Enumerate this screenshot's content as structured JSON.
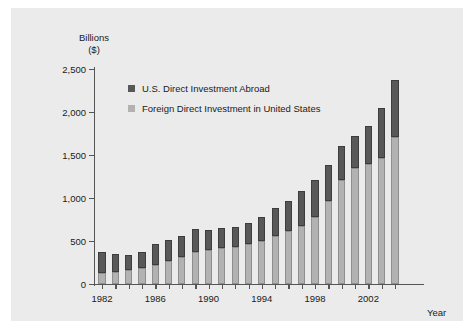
{
  "chart_data": {
    "type": "bar",
    "stacked": true,
    "title": "",
    "subtitle": "",
    "xlabel": "Year",
    "ylabel": "Billions\n($)",
    "ylim": [
      0,
      2500
    ],
    "ytick_labels": [
      "0",
      "500",
      "1,000",
      "1,500",
      "2,000",
      "2,500"
    ],
    "ytick_values": [
      0,
      500,
      1000,
      1500,
      2000,
      2500
    ],
    "xtick_labels": [
      "1982",
      "1986",
      "1990",
      "1994",
      "1998",
      "2002"
    ],
    "xtick_values": [
      1982,
      1986,
      1990,
      1994,
      1998,
      2002
    ],
    "grid": false,
    "legend_position": "upper-left-inside",
    "categories": [
      1982,
      1983,
      1984,
      1985,
      1986,
      1987,
      1988,
      1989,
      1990,
      1991,
      1992,
      1993,
      1994,
      1995,
      1996,
      1997,
      1998,
      1999,
      2000,
      2001,
      2002,
      2003,
      2004
    ],
    "series": [
      {
        "name": "Foreign Direct Investment in United States",
        "color": "#b2b2b2",
        "values": [
          125,
          137,
          165,
          185,
          220,
          265,
          315,
          375,
          395,
          420,
          425,
          470,
          500,
          560,
          620,
          680,
          780,
          960,
          1215,
          1345,
          1400,
          1470,
          1710
        ]
      },
      {
        "name": "U.S. Direct Investment Abroad",
        "color": "#585858",
        "values": [
          245,
          210,
          175,
          185,
          240,
          250,
          245,
          260,
          235,
          230,
          235,
          240,
          280,
          320,
          350,
          400,
          430,
          420,
          385,
          380,
          440,
          575,
          660
        ]
      }
    ],
    "totals": [
      370,
      347,
      340,
      370,
      460,
      515,
      560,
      635,
      630,
      650,
      660,
      710,
      780,
      880,
      970,
      1080,
      1210,
      1380,
      1600,
      1725,
      1840,
      2045,
      2370
    ]
  },
  "legend": {
    "items": [
      {
        "label": "U.S. Direct Investment Abroad",
        "swatch": "dark"
      },
      {
        "label": "Foreign Direct Investment in United States",
        "swatch": "light"
      }
    ]
  }
}
